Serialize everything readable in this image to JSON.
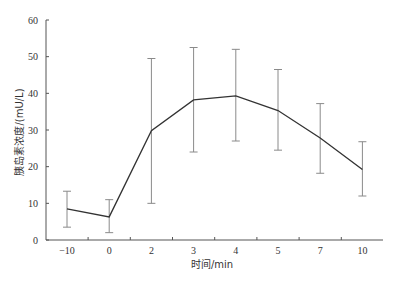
{
  "chart_data": {
    "type": "line",
    "title": "",
    "xlabel": "时间/min",
    "ylabel": "胰岛素浓度/(mU/L)",
    "categories": [
      "-10",
      "0",
      "2",
      "3",
      "4",
      "5",
      "7",
      "10"
    ],
    "series": [
      {
        "name": "胰岛素浓度",
        "values": [
          8.5,
          6.3,
          29.8,
          38.2,
          39.3,
          35.3,
          27.8,
          19.2
        ],
        "error_low": [
          3.5,
          2.0,
          10.0,
          24.0,
          27.0,
          24.5,
          18.2,
          12.0
        ],
        "error_high": [
          13.3,
          11.0,
          49.5,
          52.5,
          52.0,
          46.5,
          37.2,
          26.8
        ]
      }
    ],
    "ylim": [
      0,
      60
    ],
    "yticks": [
      0,
      10,
      20,
      30,
      40,
      50,
      60
    ],
    "grid": false,
    "legend": "none"
  },
  "colors": {
    "line": "#333333",
    "errorbar": "#8a8a8a",
    "axis": "#555555"
  }
}
